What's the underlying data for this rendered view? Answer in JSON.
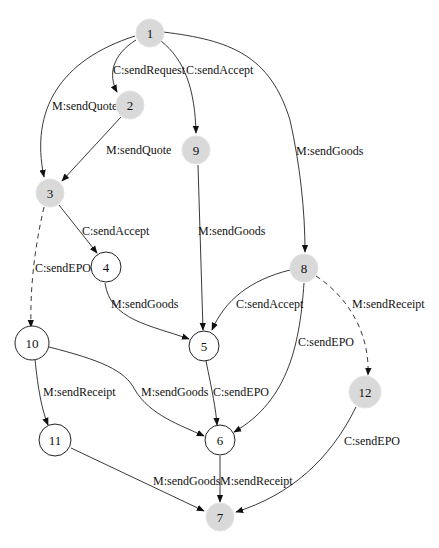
{
  "diagram": {
    "type": "state-transition-graph",
    "nodes": [
      {
        "id": "1",
        "label": "1",
        "style": "shaded"
      },
      {
        "id": "2",
        "label": "2",
        "style": "shaded"
      },
      {
        "id": "3",
        "label": "3",
        "style": "shaded"
      },
      {
        "id": "4",
        "label": "4",
        "style": "plain"
      },
      {
        "id": "5",
        "label": "5",
        "style": "plain"
      },
      {
        "id": "6",
        "label": "6",
        "style": "plain"
      },
      {
        "id": "7",
        "label": "7",
        "style": "shaded"
      },
      {
        "id": "8",
        "label": "8",
        "style": "shaded"
      },
      {
        "id": "9",
        "label": "9",
        "style": "shaded"
      },
      {
        "id": "10",
        "label": "10",
        "style": "plain"
      },
      {
        "id": "11",
        "label": "11",
        "style": "plain"
      },
      {
        "id": "12",
        "label": "12",
        "style": "shaded"
      }
    ],
    "edges": [
      {
        "from": "1",
        "to": "2",
        "label": "C:sendRequest",
        "style": "solid"
      },
      {
        "from": "1",
        "to": "9",
        "label": "C:sendAccept",
        "style": "solid"
      },
      {
        "from": "1",
        "to": "3",
        "label": "M:sendQuote",
        "style": "solid"
      },
      {
        "from": "1",
        "to": "8",
        "label": "M:sendGoods",
        "style": "solid"
      },
      {
        "from": "2",
        "to": "3",
        "label": "M:sendQuote",
        "style": "solid"
      },
      {
        "from": "9",
        "to": "5",
        "label": "M:sendGoods",
        "style": "solid"
      },
      {
        "from": "3",
        "to": "4",
        "label": "C:sendAccept",
        "style": "solid"
      },
      {
        "from": "3",
        "to": "10",
        "label": "C:sendEPO",
        "style": "dashed"
      },
      {
        "from": "4",
        "to": "5",
        "label": "M:sendGoods",
        "style": "solid"
      },
      {
        "from": "8",
        "to": "5",
        "label": "C:sendAccept",
        "style": "solid"
      },
      {
        "from": "8",
        "to": "6",
        "label": "C:sendEPO",
        "style": "solid"
      },
      {
        "from": "8",
        "to": "12",
        "label": "M:sendReceipt",
        "style": "dashed"
      },
      {
        "from": "10",
        "to": "11",
        "label": "M:sendReceipt",
        "style": "solid"
      },
      {
        "from": "10",
        "to": "6",
        "label": "M:sendGoods",
        "style": "solid"
      },
      {
        "from": "5",
        "to": "6",
        "label": "C:sendEPO",
        "style": "solid"
      },
      {
        "from": "12",
        "to": "7",
        "label": "C:sendEPO",
        "style": "solid"
      },
      {
        "from": "11",
        "to": "7",
        "label": "M:sendGoods",
        "style": "solid"
      },
      {
        "from": "6",
        "to": "7",
        "label": "M:sendReceipt",
        "style": "solid"
      }
    ],
    "colors": {
      "shaded_fill": "#d9d9d9",
      "plain_fill": "#ffffff",
      "stroke": "#222222"
    }
  }
}
